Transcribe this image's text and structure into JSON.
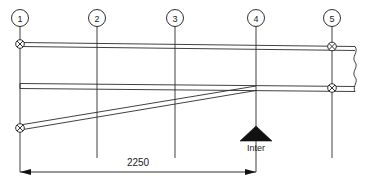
{
  "drawing": {
    "type": "structural-elevation",
    "title": "",
    "gridlines": [
      {
        "label": "1",
        "x": 20
      },
      {
        "label": "2",
        "x": 97
      },
      {
        "label": "3",
        "x": 175
      },
      {
        "label": "4",
        "x": 256
      },
      {
        "label": "5",
        "x": 332
      }
    ],
    "dimensions": [
      {
        "value": "2250",
        "from_gridline": "1",
        "to_gridline": "4",
        "x_start": 20,
        "x_end": 256,
        "y": 172,
        "text_x": 138,
        "text_y": 163
      }
    ],
    "supports": [
      {
        "label": "Inter",
        "gridline": "4",
        "x": 256,
        "y": 131,
        "label_x": 256,
        "label_y": 151
      }
    ],
    "nodes": [
      {
        "id": "node-g1-top",
        "x": 20,
        "y": 44
      },
      {
        "id": "node-g1-bottom",
        "x": 20,
        "y": 128
      },
      {
        "id": "node-g5-top",
        "x": 332,
        "y": 48
      },
      {
        "id": "node-g5-mid",
        "x": 332,
        "y": 88
      }
    ],
    "colors": {
      "line": "#1a1a1a",
      "background": "#ffffff",
      "fill": "#ffffff"
    }
  }
}
